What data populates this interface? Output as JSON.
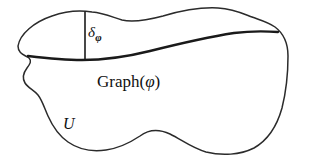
{
  "figure": {
    "type": "mathematical-diagram",
    "background_color": "#ffffff",
    "stroke_color": "#2b2b2b",
    "curve_color": "#1a1a1a",
    "labels": {
      "delta": {
        "base": "δ",
        "subscript": "φ",
        "full": "δφ"
      },
      "graph": {
        "prefix": "Graph(",
        "arg": "φ",
        "suffix": ")",
        "full": "Graph(φ)"
      },
      "region": "U"
    },
    "elements": {
      "region_boundary_name": "region-U-boundary",
      "graph_curve_name": "graph-phi-curve",
      "delta_segment_name": "delta-phi-segment"
    }
  }
}
